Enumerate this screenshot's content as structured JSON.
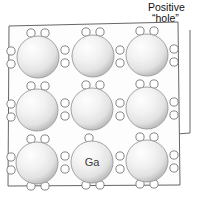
{
  "figure": {
    "name": "semiconductor-doping-positive-hole-diagram",
    "background_color": "#ffffff",
    "line_color": "#555555",
    "callout": {
      "line1": "Positive",
      "line2": "“hole”",
      "text_color": "#111111",
      "leader": {
        "description": "leader line from callout down and left to the single unpaired circle",
        "points": "190,30 190,133 97,140"
      }
    },
    "crystal_box": {
      "name": "crystal-lattice-box",
      "outline_points": "9,26 178,22 180,185 8,186",
      "stroke": "#666666",
      "fill": "#fdfdfd"
    },
    "atoms": [
      {
        "id": "atom-r1c1",
        "cx": 38,
        "cy": 57,
        "r": 21,
        "label": ""
      },
      {
        "id": "atom-r1c2",
        "cx": 93,
        "cy": 56,
        "r": 21,
        "label": ""
      },
      {
        "id": "atom-r1c3",
        "cx": 147,
        "cy": 55,
        "r": 21,
        "label": ""
      },
      {
        "id": "atom-r2c1",
        "cx": 37,
        "cy": 110,
        "r": 21,
        "label": ""
      },
      {
        "id": "atom-r2c2",
        "cx": 92,
        "cy": 109,
        "r": 21,
        "label": ""
      },
      {
        "id": "atom-r2c3",
        "cx": 147,
        "cy": 108,
        "r": 21,
        "label": ""
      },
      {
        "id": "atom-r3c1",
        "cx": 37,
        "cy": 163,
        "r": 21,
        "label": ""
      },
      {
        "id": "atom-r3c2",
        "cx": 92,
        "cy": 162,
        "r": 21,
        "label": "Ga"
      },
      {
        "id": "atom-r3c3",
        "cx": 147,
        "cy": 161,
        "r": 21,
        "label": ""
      }
    ],
    "atom_label_color": "#3a3a3a",
    "sphere_colors": {
      "highlight": "#fefefe",
      "mid": "#ededed",
      "edge": "#bdbdbd",
      "outline": "#9a9a9a"
    },
    "electron_circle": {
      "r": 4.1,
      "stroke": "#777777",
      "fill": "#ffffff",
      "name": "electron-circle"
    },
    "electron_pairs_horizontal": [
      {
        "name": "electron-pair-top-r1c1",
        "x1": 31,
        "x2": 45,
        "y": 33
      },
      {
        "name": "electron-pair-top-r1c2",
        "x1": 86,
        "x2": 100,
        "y": 32
      },
      {
        "name": "electron-pair-top-r1c3",
        "x1": 140,
        "x2": 154,
        "y": 31
      },
      {
        "name": "electron-pair-top-r2c1",
        "x1": 31,
        "x2": 45,
        "y": 86
      },
      {
        "name": "electron-pair-top-r2c2",
        "x1": 86,
        "x2": 100,
        "y": 85
      },
      {
        "name": "electron-pair-top-r2c3",
        "x1": 140,
        "x2": 154,
        "y": 84
      },
      {
        "name": "electron-pair-top-r3c1",
        "x1": 31,
        "x2": 45,
        "y": 139
      },
      {
        "name": "electron-pair-top-r3c3",
        "x1": 140,
        "x2": 154,
        "y": 137
      },
      {
        "name": "electron-pair-bottom-r3c1",
        "x1": 31,
        "x2": 45,
        "y": 186
      },
      {
        "name": "electron-pair-bottom-r3c2",
        "x1": 86,
        "x2": 100,
        "y": 185
      },
      {
        "name": "electron-pair-bottom-r3c3",
        "x1": 140,
        "x2": 154,
        "y": 184
      }
    ],
    "electron_pairs_vertical": [
      {
        "name": "electron-pair-left-r1c1",
        "x": 11,
        "y1": 51,
        "y2": 64
      },
      {
        "name": "electron-pair-right-r1c1",
        "x": 65,
        "y1": 50,
        "y2": 63
      },
      {
        "name": "electron-pair-right-r1c2",
        "x": 120,
        "y1": 50,
        "y2": 63
      },
      {
        "name": "electron-pair-right-r1c3",
        "x": 174,
        "y1": 49,
        "y2": 62
      },
      {
        "name": "electron-pair-left-r2c1",
        "x": 11,
        "y1": 104,
        "y2": 117
      },
      {
        "name": "electron-pair-right-r2c1",
        "x": 65,
        "y1": 103,
        "y2": 116
      },
      {
        "name": "electron-pair-right-r2c2",
        "x": 120,
        "y1": 103,
        "y2": 116
      },
      {
        "name": "electron-pair-right-r2c3",
        "x": 174,
        "y1": 102,
        "y2": 115
      },
      {
        "name": "electron-pair-left-r3c1",
        "x": 11,
        "y1": 157,
        "y2": 170
      },
      {
        "name": "electron-pair-right-r3c1",
        "x": 65,
        "y1": 156,
        "y2": 169
      },
      {
        "name": "electron-pair-right-r3c2",
        "x": 120,
        "y1": 156,
        "y2": 169
      },
      {
        "name": "electron-pair-right-r3c3",
        "x": 174,
        "y1": 155,
        "y2": 168
      }
    ],
    "hole_circle": {
      "name": "positive-hole-circle",
      "cx": 89,
      "cy": 138,
      "r": 4.1,
      "note": "single unpaired circle marking the positive hole above the Ga atom"
    }
  }
}
